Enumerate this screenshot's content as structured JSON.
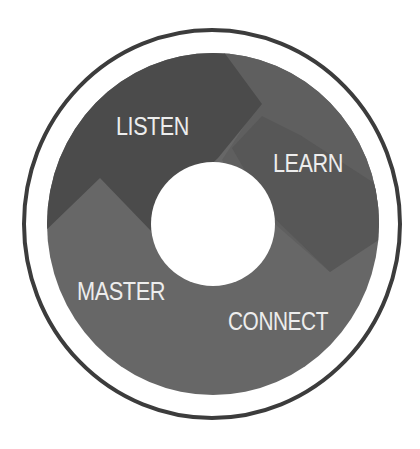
{
  "diagram": {
    "type": "ring-cycle",
    "colors": {
      "background": "#ffffff",
      "outer_ring": "#3c3c3c",
      "segment_dark": "#4b4b4b",
      "segment_mid_dark": "#575757",
      "segment_band": "#5f5f5f",
      "segment_medium": "#676767",
      "center_hole": "#ffffff",
      "label_text": "#ededed"
    },
    "segments": [
      {
        "id": "listen",
        "label": "LISTEN",
        "position": "top-left"
      },
      {
        "id": "learn",
        "label": "LEARN",
        "position": "top-right"
      },
      {
        "id": "connect",
        "label": "CONNECT",
        "position": "bottom-right"
      },
      {
        "id": "master",
        "label": "MASTER",
        "position": "bottom-left"
      }
    ]
  }
}
